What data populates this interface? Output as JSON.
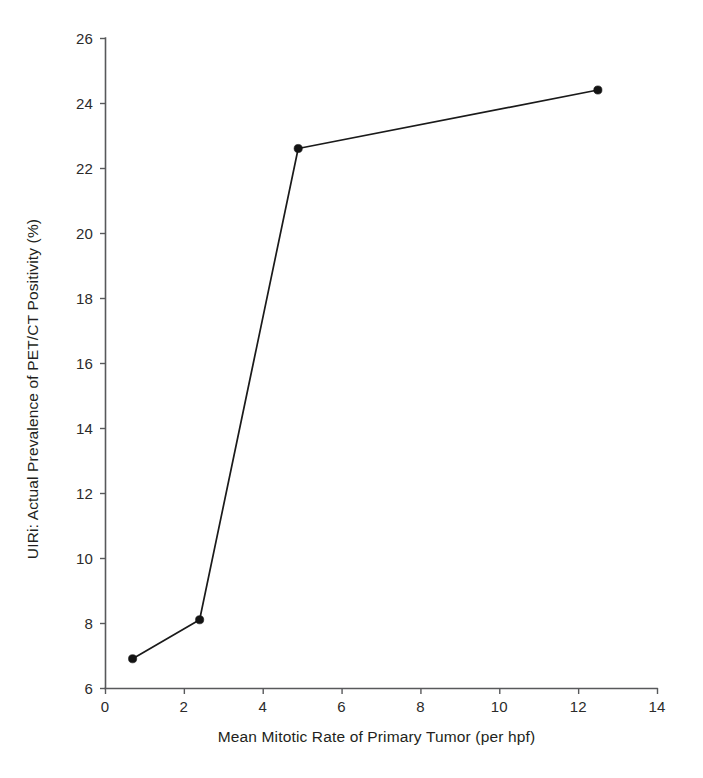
{
  "chart_data": {
    "type": "line",
    "title": "",
    "subtitle": "",
    "xlabel": "Mean Mitotic Rate of Primary Tumor (per hpf)",
    "ylabel": "UIRi: Actual Prevalence of PET/CT Positivity (%)",
    "xlim": [
      0,
      14
    ],
    "ylim": [
      6,
      26
    ],
    "xticks": [
      0,
      2,
      4,
      6,
      8,
      10,
      12,
      14
    ],
    "yticks": [
      6,
      8,
      10,
      12,
      14,
      16,
      18,
      20,
      22,
      24,
      26
    ],
    "xtick_labels": [
      "0",
      "2",
      "4",
      "6",
      "8",
      "10",
      "12",
      "14"
    ],
    "ytick_labels": [
      "6",
      "8",
      "10",
      "12",
      "14",
      "16",
      "18",
      "20",
      "22",
      "24",
      "26"
    ],
    "grid": false,
    "legend": null,
    "series": [
      {
        "name": "PET/CT positivity vs mitotic rate",
        "marker": "filled-circle",
        "color": "#131313",
        "x": [
          0.7,
          2.4,
          4.9,
          12.5
        ],
        "y": [
          6.9,
          8.1,
          22.6,
          24.4
        ],
        "points": [
          {
            "x": 0.7,
            "y": 6.9
          },
          {
            "x": 2.4,
            "y": 8.1
          },
          {
            "x": 4.9,
            "y": 22.6
          },
          {
            "x": 12.5,
            "y": 24.4
          }
        ]
      }
    ],
    "annotations": []
  },
  "style": {
    "background": "#ffffff",
    "axis_color": "#58595b",
    "text_color": "#231f20",
    "line_color": "#131313"
  }
}
